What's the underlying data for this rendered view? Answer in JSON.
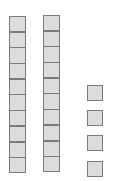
{
  "diagram": {
    "title": "",
    "type": "base-ten-blocks",
    "represented_value": 24,
    "tens_rods": [
      {
        "id": "rod-1",
        "cells": 10,
        "x": 9,
        "y": 16
      },
      {
        "id": "rod-2",
        "cells": 10,
        "x": 43,
        "y": 15
      }
    ],
    "units": [
      {
        "id": "unit-1",
        "x": 87,
        "y": 85
      },
      {
        "id": "unit-2",
        "x": 87,
        "y": 110
      },
      {
        "id": "unit-3",
        "x": 87,
        "y": 135
      },
      {
        "id": "unit-4",
        "x": 87,
        "y": 161
      }
    ],
    "colors": {
      "fill": "#dcdcdc",
      "border": "#7a7a7a",
      "background": "#ffffff"
    }
  }
}
